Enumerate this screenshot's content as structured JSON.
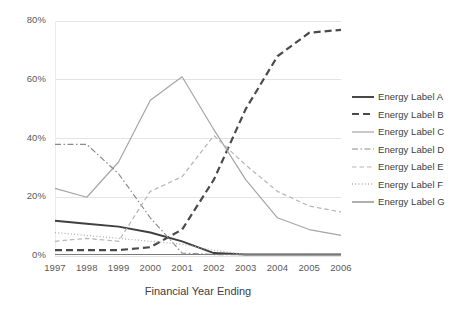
{
  "chart_data": {
    "type": "line",
    "title": "",
    "xlabel": "Financial Year Ending",
    "ylabel": "",
    "x": [
      1997,
      1998,
      1999,
      2000,
      2001,
      2002,
      2003,
      2004,
      2005,
      2006
    ],
    "xticklabels": [
      "1997",
      "1998",
      "1999",
      "2000",
      "2001",
      "2002",
      "2003",
      "2004",
      "2005",
      "2006"
    ],
    "yticklabels": [
      "0%",
      "20%",
      "40%",
      "60%",
      "80%"
    ],
    "yticks": [
      0,
      20,
      40,
      60,
      80
    ],
    "ylim": [
      0,
      80
    ],
    "ytick_suffix": "%",
    "grid": true,
    "grid_axis": "y",
    "legend_position": "right",
    "series": [
      {
        "name": "Energy Label A",
        "values": [
          12,
          11,
          10,
          8,
          5,
          1,
          0.5,
          0.5,
          0.5,
          0.5
        ],
        "color": "#3f3f3f",
        "style": "solid",
        "width": 1.9
      },
      {
        "name": "Energy Label B",
        "values": [
          2,
          2,
          2,
          3,
          9,
          26,
          50,
          68,
          76,
          77
        ],
        "color": "#4a4a4a",
        "style": "dashed",
        "width": 2.2
      },
      {
        "name": "Energy Label C",
        "values": [
          23,
          20,
          32,
          53,
          61,
          43,
          26,
          13,
          9,
          7
        ],
        "color": "#a6a6a6",
        "style": "solid",
        "width": 1.2
      },
      {
        "name": "Energy Label D",
        "values": [
          38,
          38,
          28,
          13,
          1,
          0.5,
          0.5,
          0.5,
          0.5,
          0.5
        ],
        "color": "#8c8c8c",
        "style": "dashdot",
        "width": 1.2
      },
      {
        "name": "Energy Label E",
        "values": [
          5,
          6,
          5,
          22,
          27,
          41,
          31,
          22,
          17,
          15
        ],
        "color": "#b5b5b5",
        "style": "dashed",
        "width": 1.2
      },
      {
        "name": "Energy Label F",
        "values": [
          8,
          7,
          6,
          5,
          4,
          2,
          0.5,
          0.5,
          0.5,
          0.5
        ],
        "color": "#b0b0b0",
        "style": "dotted",
        "width": 1.3
      },
      {
        "name": "Energy Label G",
        "values": [
          0.5,
          0.5,
          0.5,
          0.5,
          0.5,
          0.5,
          0.5,
          0.5,
          0.5,
          0.5
        ],
        "color": "#7a7a7a",
        "style": "solid",
        "width": 1.1
      }
    ]
  },
  "legend": {
    "items": [
      {
        "label": "Energy Label A"
      },
      {
        "label": "Energy Label B"
      },
      {
        "label": "Energy Label C"
      },
      {
        "label": "Energy Label D"
      },
      {
        "label": "Energy Label E"
      },
      {
        "label": "Energy Label F"
      },
      {
        "label": "Energy Label G"
      }
    ]
  },
  "colors": {
    "grid": "#e3e3e3",
    "tick_text": "#5a5a5a",
    "axis_label": "#404040",
    "background": "#ffffff"
  }
}
